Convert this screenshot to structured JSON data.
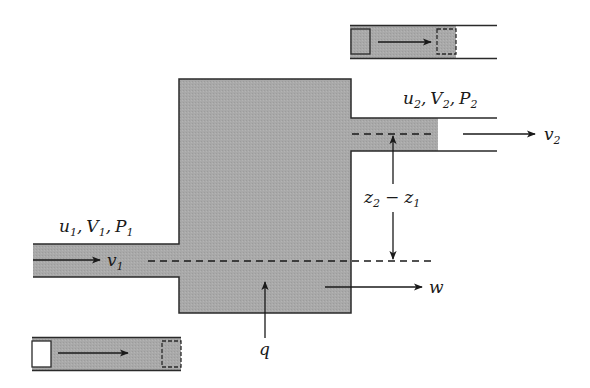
{
  "diagram": {
    "type": "open-system control volume (steady flow energy balance)",
    "colors": {
      "fill": "#a9a9a9",
      "stroke": "#2a2a2a",
      "background": "#ffffff"
    },
    "inlet": {
      "state_label": {
        "u": "u",
        "u_sub": "1",
        "V": "V",
        "V_sub": "1",
        "P": "P",
        "P_sub": "1"
      },
      "velocity_label": "v",
      "velocity_sub": "1"
    },
    "outlet": {
      "state_label": {
        "u": "u",
        "u_sub": "2",
        "V": "V",
        "V_sub": "2",
        "P": "P",
        "P_sub": "2"
      },
      "velocity_label": "v",
      "velocity_sub": "2"
    },
    "elevation": {
      "a": "z",
      "a_sub": "2",
      "minus": "−",
      "b": "z",
      "b_sub": "1"
    },
    "heat_label": "q",
    "work_label": "w",
    "comma": ","
  }
}
